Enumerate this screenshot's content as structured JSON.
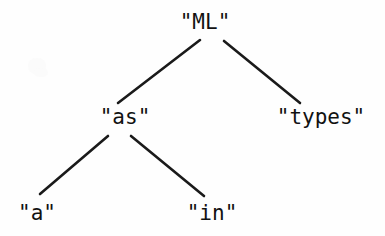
{
  "figure": {
    "kind": "tree-diagram",
    "width": 385,
    "height": 236,
    "background_color": "#fefefe",
    "ink_color": "#111111",
    "edge_color": "#1a1a1a"
  },
  "nodes": {
    "root": {
      "label": "\"ML\"",
      "x": 205,
      "y": 22
    },
    "left": {
      "label": "\"as\"",
      "x": 125,
      "y": 117
    },
    "right": {
      "label": "\"types\"",
      "x": 321,
      "y": 117
    },
    "leaf_left": {
      "label": "\"a\"",
      "x": 37,
      "y": 213
    },
    "leaf_right": {
      "label": "\"in\"",
      "x": 212,
      "y": 213
    }
  },
  "edges": [
    {
      "name": "root-to-left",
      "x1": 200,
      "y1": 40,
      "x2": 118,
      "y2": 103
    },
    {
      "name": "root-to-right",
      "x1": 224,
      "y1": 41,
      "x2": 300,
      "y2": 103
    },
    {
      "name": "left-to-leaf-left",
      "x1": 108,
      "y1": 136,
      "x2": 40,
      "y2": 194
    },
    {
      "name": "left-to-leaf-right",
      "x1": 131,
      "y1": 136,
      "x2": 204,
      "y2": 196
    }
  ],
  "chart_data": {
    "type": "tree",
    "title": "",
    "nodes": [
      {
        "id": "ml",
        "label": "\"ML\"",
        "depth": 0,
        "parent": null
      },
      {
        "id": "as",
        "label": "\"as\"",
        "depth": 1,
        "parent": "ml"
      },
      {
        "id": "types",
        "label": "\"types\"",
        "depth": 1,
        "parent": "ml"
      },
      {
        "id": "a",
        "label": "\"a\"",
        "depth": 2,
        "parent": "as"
      },
      {
        "id": "in",
        "label": "\"in\"",
        "depth": 2,
        "parent": "as"
      }
    ],
    "links": [
      {
        "from": "ml",
        "to": "as"
      },
      {
        "from": "ml",
        "to": "types"
      },
      {
        "from": "as",
        "to": "a"
      },
      {
        "from": "as",
        "to": "in"
      }
    ]
  }
}
